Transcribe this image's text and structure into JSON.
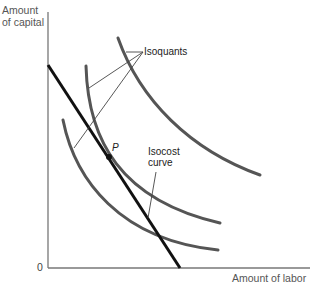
{
  "diagram": {
    "axes": {
      "y_label_line1": "Amount",
      "y_label_line2": "of capital",
      "x_label": "Amount of labor",
      "origin": "0"
    },
    "labels": {
      "isoquants": "Isoquants",
      "point": "P",
      "isocost_line1": "Isocost",
      "isocost_line2": "curve"
    },
    "elements": {
      "isoquant_count": 3,
      "isocost_lines": 1,
      "tangency_point": "P"
    },
    "colors": {
      "axis": "#777777",
      "isoquant": "#555555",
      "isocost": "#111111",
      "leader": "#444444"
    }
  }
}
